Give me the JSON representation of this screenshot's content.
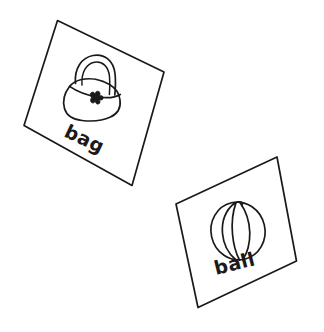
{
  "scene": {
    "title": "Hand-drawn flashcards",
    "background_color": "#ffffff",
    "ink_color": "#1a1a1a",
    "width": 324,
    "height": 332,
    "style": "black-and-white line drawing"
  },
  "cards": [
    {
      "id": "bag-card",
      "label": "bag",
      "icon": "handbag-icon",
      "rotation_deg": 25,
      "corners": {
        "top_left": "57,20",
        "top_right": "164,72",
        "bottom_right": "132,185",
        "bottom_left": "24,125"
      },
      "drawing_parts": [
        "handle-arch",
        "bag-body",
        "bag-flap",
        "flower-clasp"
      ]
    },
    {
      "id": "ball-card",
      "label": "ball",
      "icon": "beach-ball-icon",
      "rotation_deg": -13,
      "corners": {
        "top_left": "176,204",
        "top_right": "277,157",
        "bottom_right": "296,261",
        "bottom_left": "198,307"
      },
      "drawing_parts": [
        "ball-circle",
        "segment-line-left",
        "segment-line-center",
        "segment-line-right",
        "valve-cap"
      ]
    }
  ]
}
